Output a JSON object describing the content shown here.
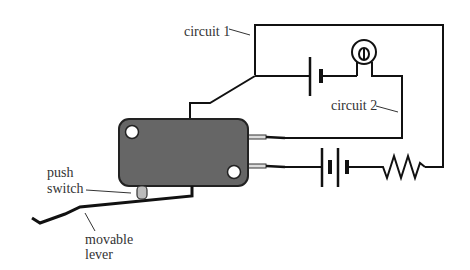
{
  "diagram": {
    "labels": {
      "circuit1": "circuit 1",
      "circuit2": "circuit 2",
      "push_switch_line1": "push",
      "push_switch_line2": "switch",
      "lever_line1": "movable",
      "lever_line2": "lever"
    },
    "components": [
      "switch-body",
      "push-switch",
      "movable-lever",
      "battery-1cell",
      "bulb",
      "battery-2cell",
      "resistor"
    ],
    "colors": {
      "switch_body": "#666666",
      "line": "#111111",
      "plunger": "#bbbbbb"
    }
  }
}
